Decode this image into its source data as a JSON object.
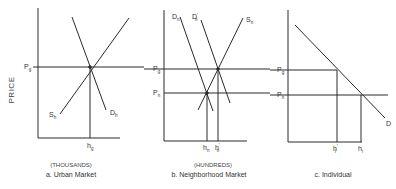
{
  "figure": {
    "y_axis_title": "PRICE",
    "panels": [
      {
        "id": "a",
        "caption": "a. Urban Market",
        "unit": "(THOUSANDS)",
        "price_labels": [
          {
            "base": "P",
            "sub": "g"
          }
        ],
        "quantity_labels": [
          {
            "base": "h",
            "sub": "g"
          }
        ],
        "curves": [
          {
            "base": "S",
            "sub": "h",
            "type": "supply"
          },
          {
            "base": "D",
            "sub": "h",
            "type": "demand"
          }
        ]
      },
      {
        "id": "b",
        "caption": "b. Neighborhood Market",
        "unit": "(HUNDREDS)",
        "price_labels": [
          {
            "base": "P",
            "sub": "g"
          },
          {
            "base": "P",
            "sub": "n"
          }
        ],
        "quantity_labels": [
          {
            "base": "h",
            "sub": "n"
          },
          {
            "base": "h",
            "prime": "′",
            "sub": "n"
          }
        ],
        "curves": [
          {
            "base": "D",
            "sub": "n",
            "type": "demand"
          },
          {
            "base": "D",
            "prime": "′",
            "sub": "n",
            "type": "demand-shifted"
          },
          {
            "base": "S",
            "sub": "n",
            "type": "supply"
          }
        ]
      },
      {
        "id": "c",
        "caption": "c. Individual",
        "unit": "",
        "price_labels": [
          {
            "base": "P",
            "sub": "g"
          },
          {
            "base": "P",
            "sub": "n"
          }
        ],
        "quantity_labels": [
          {
            "base": "h",
            "prime": "′",
            "sub": "i"
          },
          {
            "base": "h",
            "sub": "i"
          }
        ],
        "curves": [
          {
            "base": "D",
            "type": "demand"
          }
        ]
      }
    ]
  }
}
